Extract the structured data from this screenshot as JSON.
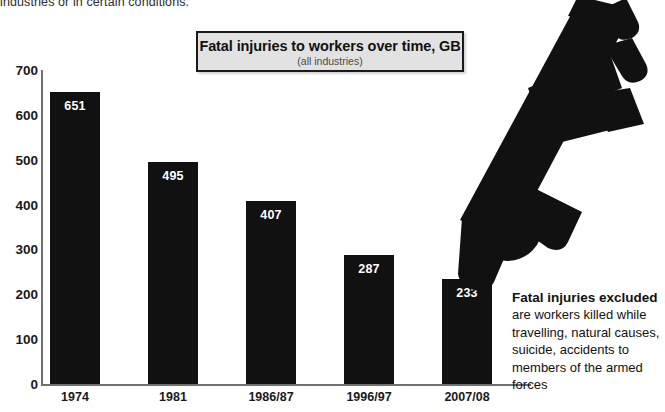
{
  "top_caption": "industries or in certain conditions.",
  "title": {
    "main": "Fatal injuries to workers over time, GB",
    "sub": "(all industries)"
  },
  "annotation": {
    "bold": "Fatal injuries excluded",
    "rest": " are workers killed while travelling, natural causes, suicide, accidents to members of the armed forces"
  },
  "graphic": {
    "name": "falling-worker-pictogram"
  },
  "colors": {
    "bar": "#111111",
    "axis": "#6f6f6f",
    "title_box_fill": "#e2e2e2",
    "title_box_border": "#1a1a1a",
    "value_label": "#ffffff",
    "text": "#111111"
  },
  "chart_data": {
    "type": "bar",
    "title": "Fatal injuries to workers over time, GB",
    "subtitle": "(all industries)",
    "xlabel": "",
    "ylabel": "",
    "categories": [
      "1974",
      "1981",
      "1986/87",
      "1996/97",
      "2007/08"
    ],
    "values": [
      651,
      495,
      407,
      287,
      233
    ],
    "ylim": [
      0,
      700
    ],
    "yticks": [
      0,
      100,
      200,
      300,
      400,
      500,
      600,
      700
    ],
    "ytick_labels": [
      "0",
      "100",
      "200",
      "300",
      "400",
      "500",
      "600",
      "700"
    ],
    "grid": false,
    "legend": null,
    "bar_value_labels": [
      "651",
      "495",
      "407",
      "287",
      "233"
    ]
  }
}
